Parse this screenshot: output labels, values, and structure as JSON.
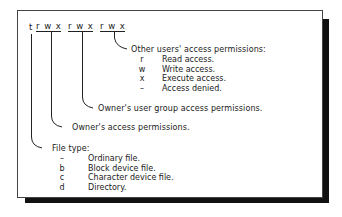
{
  "diagram": {
    "permission_string": {
      "type_char": "t",
      "groups": [
        {
          "name": "owner",
          "chars": "r w x"
        },
        {
          "name": "group",
          "chars": "r w x"
        },
        {
          "name": "other",
          "chars": "r w x"
        }
      ]
    },
    "other_users": {
      "title": "Other users' access permissions:",
      "items": [
        {
          "key": "r",
          "desc": "Read access."
        },
        {
          "key": "w",
          "desc": "Write access."
        },
        {
          "key": "x",
          "desc": "Execute access."
        },
        {
          "key": "–",
          "desc": "Access denied."
        }
      ]
    },
    "group_label": "Owner's user group access permissions.",
    "owner_label": "Owner's access permissions.",
    "file_type": {
      "title": "File type:",
      "items": [
        {
          "key": "–",
          "desc": "Ordinary file."
        },
        {
          "key": "b",
          "desc": "Block device file."
        },
        {
          "key": "c",
          "desc": "Character device file."
        },
        {
          "key": "d",
          "desc": "Directory."
        }
      ]
    },
    "colors": {
      "line": "#222222",
      "shadow": "#111111",
      "background": "#ffffff"
    }
  }
}
